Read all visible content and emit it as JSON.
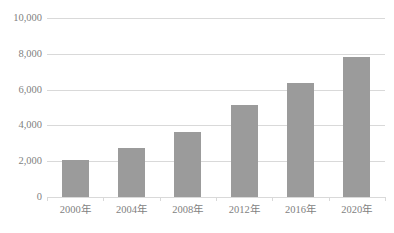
{
  "chart_data": {
    "type": "bar",
    "title": "",
    "subtitle": "",
    "xlabel": "",
    "ylabel": "",
    "categories": [
      "2000年",
      "2004年",
      "2008年",
      "2012年",
      "2016年",
      "2020年"
    ],
    "values": [
      2050,
      2750,
      3650,
      5150,
      6350,
      7850
    ],
    "series": [
      {
        "name": "",
        "values": [
          2050,
          2750,
          3650,
          5150,
          6350,
          7850
        ]
      }
    ],
    "ylim": [
      0,
      10000
    ],
    "y_ticks": [
      0,
      2000,
      4000,
      6000,
      8000,
      10000
    ],
    "y_tick_labels": [
      "0",
      "2,000",
      "4,000",
      "6,000",
      "8,000",
      "10,000"
    ],
    "grid": true,
    "legend": "none",
    "bar_color": "#9b9b9b",
    "gridline_color": "#d9d9d9",
    "text_color": "#7f7f7f",
    "background_color": "#ffffff"
  },
  "axis": {
    "y_labels": [
      {
        "text": "10,000",
        "value": 10000
      },
      {
        "text": "8,000",
        "value": 8000
      },
      {
        "text": "6,000",
        "value": 6000
      },
      {
        "text": "4,000",
        "value": 4000
      },
      {
        "text": "2,000",
        "value": 2000
      },
      {
        "text": "0",
        "value": 0
      }
    ],
    "x_labels": [
      {
        "text": "2000年"
      },
      {
        "text": "2004年"
      },
      {
        "text": "2008年"
      },
      {
        "text": "2012年"
      },
      {
        "text": "2016年"
      },
      {
        "text": "2020年"
      }
    ]
  }
}
